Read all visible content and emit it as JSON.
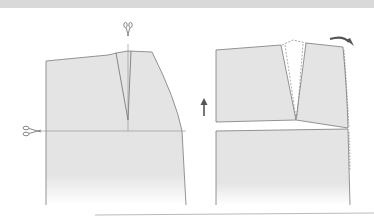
{
  "diagram": {
    "colors": {
      "top_band": "#d9d9d9",
      "pattern_fill": "#e3e3e3",
      "pattern_stroke": "#7a7a7a",
      "arrow": "#6b6b6b",
      "dashed_dart": "#8a8a8a",
      "bottom_rule": "#9a9a9a"
    },
    "left_panel": {
      "label": "",
      "icons": [
        "scissors-icon-top",
        "scissors-icon-left"
      ]
    },
    "right_panel": {
      "label": "",
      "icons": [
        "up-arrow-icon",
        "curved-arrow-icon"
      ]
    }
  }
}
